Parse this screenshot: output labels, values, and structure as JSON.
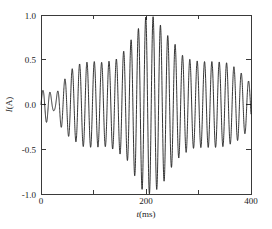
{
  "chart_data": {
    "type": "line",
    "title": "",
    "subtitle": "",
    "xlabel": "t(ms)",
    "xlabel_italic_part": "t",
    "xlabel_unit_part": "(ms)",
    "ylabel": "I(A)",
    "ylabel_italic_part": "I",
    "ylabel_unit_part": "(A)",
    "xlim": [
      0,
      400
    ],
    "ylim": [
      -1.0,
      1.0
    ],
    "x_major_ticks": [
      0,
      200,
      400
    ],
    "x_major_tick_labels": [
      "0",
      "200",
      "400"
    ],
    "x_minor_ticks": [
      100,
      300
    ],
    "y_major_ticks": [
      -1.0,
      -0.5,
      0.0,
      0.5,
      1.0
    ],
    "y_major_tick_labels": [
      "-1.0",
      "-0.5",
      "0.0",
      "0.5",
      "1.0"
    ],
    "grid": false,
    "legend": null,
    "legend_position": "none",
    "line_color": "#111111",
    "frame_color": "#3a3a3a",
    "series": [
      {
        "name": "I(t)",
        "carrier_cycles": 28.5,
        "carrier_period_ms": 14.0,
        "carrier_phase_deg": 0,
        "envelope_description": "Beat envelope: node near t=25 ms, broad shoulders near amplitude 0.48, maximum amplitude 1.0 near t=205 ms, decaying to about 0.30 at t=400 ms",
        "envelope_keypoints_t": [
          0,
          10,
          25,
          40,
          60,
          80,
          100,
          120,
          140,
          160,
          180,
          195,
          205,
          215,
          230,
          250,
          270,
          290,
          310,
          330,
          350,
          370,
          385,
          400
        ],
        "envelope_keypoints_amp": [
          0.14,
          0.2,
          0.07,
          0.26,
          0.4,
          0.47,
          0.48,
          0.47,
          0.5,
          0.6,
          0.8,
          0.96,
          1.0,
          0.98,
          0.88,
          0.7,
          0.55,
          0.49,
          0.48,
          0.48,
          0.47,
          0.42,
          0.34,
          0.24
        ]
      }
    ]
  },
  "axes": {
    "y_label_full": "I(A)",
    "x_label_full": "t(ms)"
  }
}
